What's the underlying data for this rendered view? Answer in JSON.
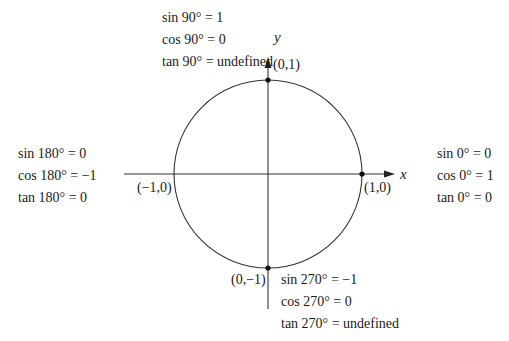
{
  "diagram": {
    "colors": {
      "stroke": "#333333",
      "text": "#1a1a1a",
      "background": "#ffffff"
    },
    "axes": {
      "x_label": "x",
      "y_label": "y"
    },
    "points": {
      "top": "(0,1)",
      "left": "(−1,0)",
      "right": "(1,0)",
      "bottom": "(0,−1)"
    },
    "angle_groups": {
      "deg90": [
        "sin 90° = 1",
        "cos 90° = 0",
        "tan 90° = undefined"
      ],
      "deg180": [
        "sin 180° = 0",
        "cos 180° = −1",
        "tan 180° = 0"
      ],
      "deg0": [
        "sin 0° = 0",
        "cos 0° = 1",
        "tan 0° = 0"
      ],
      "deg270": [
        "sin 270° = −1",
        "cos 270° = 0",
        "tan 270° = undefined"
      ]
    }
  }
}
